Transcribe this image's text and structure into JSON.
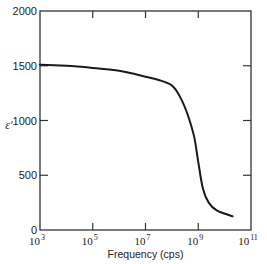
{
  "chart_data": {
    "type": "line",
    "title": "",
    "xlabel": "Frequency (cps)",
    "ylabel": "ε′",
    "xscale": "log",
    "xlim": [
      1000,
      100000000000
    ],
    "ylim": [
      0,
      2000
    ],
    "grid": false,
    "legend": null,
    "x_ticks": [
      {
        "value": 1000,
        "base": "10",
        "exp": "3"
      },
      {
        "value": 100000,
        "base": "10",
        "exp": "5"
      },
      {
        "value": 10000000,
        "base": "10",
        "exp": "7"
      },
      {
        "value": 1000000000,
        "base": "10",
        "exp": "9"
      },
      {
        "value": 100000000000,
        "base": "10",
        "exp": "11"
      }
    ],
    "y_ticks": [
      "0",
      "500",
      "1000",
      "1500",
      "2000"
    ],
    "series": [
      {
        "name": "ε′ vs frequency",
        "x": [
          1000,
          10000,
          100000,
          1000000,
          10000000,
          31600000,
          100000000,
          200000000,
          400000000,
          700000000,
          1000000000,
          1500000000,
          2500000000,
          5000000000,
          20000000000
        ],
        "y": [
          1510,
          1500,
          1480,
          1455,
          1400,
          1370,
          1320,
          1220,
          1050,
          850,
          620,
          380,
          250,
          180,
          125
        ]
      }
    ]
  }
}
